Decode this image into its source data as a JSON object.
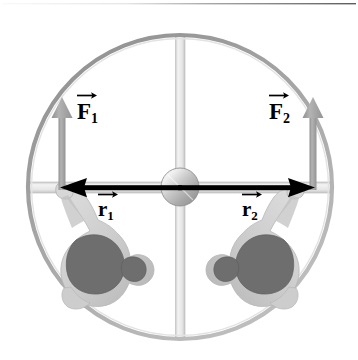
{
  "figure": {
    "type": "physics-free-body-diagram",
    "background_color": "#ffffff",
    "top_rule": {
      "present": true,
      "color": "#6e6e6e"
    },
    "platform": {
      "name": "merry-go-round-platform",
      "shape": "circle",
      "center": {
        "x": 180,
        "y": 187
      },
      "radius": 153,
      "rim_color": "#9a9a9a",
      "rim_width": 4,
      "fill_color": "#ffffff"
    },
    "spokes": [
      {
        "name": "vertical-spoke",
        "orientation": "vertical",
        "color": "#e4e4e4",
        "edge_color": "#c6c6c6",
        "thickness": 10
      },
      {
        "name": "horizontal-spoke",
        "orientation": "horizontal",
        "color": "#e4e4e4",
        "edge_color": "#c6c6c6",
        "thickness": 11
      }
    ],
    "hub": {
      "name": "center-hub",
      "shape": "sphere",
      "radius": 19,
      "highlight_color": "#f2f2f2",
      "shadow_color": "#8d8d8d"
    },
    "people": [
      {
        "name": "person-left",
        "side": "left",
        "body_color": "#6b6b6b",
        "limb_color": "#cfcfcf"
      },
      {
        "name": "person-right",
        "side": "right",
        "body_color": "#6b6b6b",
        "limb_color": "#cfcfcf"
      }
    ],
    "force_vectors": [
      {
        "id": "F1",
        "label": "F",
        "subscript": "1",
        "direction": "up",
        "color": "#a0a0a0",
        "tail": {
          "x": 62,
          "y": 188
        },
        "tip": {
          "x": 62,
          "y": 99
        },
        "label_position": {
          "x": 79,
          "y": 100
        }
      },
      {
        "id": "F2",
        "label": "F",
        "subscript": "2",
        "direction": "up",
        "color": "#a0a0a0",
        "tail": {
          "x": 313,
          "y": 188
        },
        "tip": {
          "x": 313,
          "y": 99
        },
        "label_position": {
          "x": 271,
          "y": 100
        }
      }
    ],
    "position_vectors": [
      {
        "id": "r1",
        "label": "r",
        "subscript": "1",
        "direction": "left",
        "color": "#000000",
        "tail": {
          "x": 180,
          "y": 188
        },
        "tip": {
          "x": 62,
          "y": 188
        },
        "label_position": {
          "x": 97,
          "y": 196
        }
      },
      {
        "id": "r2",
        "label": "r",
        "subscript": "2",
        "direction": "right",
        "color": "#000000",
        "tail": {
          "x": 180,
          "y": 188
        },
        "tip": {
          "x": 313,
          "y": 188
        },
        "label_position": {
          "x": 241,
          "y": 196
        }
      }
    ]
  }
}
